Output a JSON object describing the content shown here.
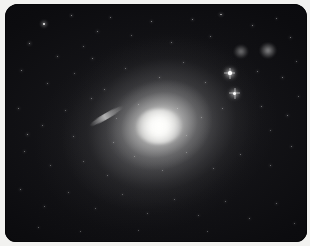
{
  "image": {
    "title": "Giant elliptical galaxy with surrounding star field",
    "subject": "elliptical-galaxy",
    "frame_color": "#f2f2f0",
    "sky_color": "#050507",
    "core_color": "#fffffd",
    "halo_color": "#9a9a9a",
    "frame": {
      "border_px": 5,
      "corner_radius_px": 13
    },
    "galaxy": {
      "label": "central elliptical galaxy",
      "center_x_pct": 50.5,
      "center_y_pct": 51.0,
      "position_angle_deg": -20,
      "core_brightness": 100,
      "halo_extent_pct": 96
    },
    "features": [
      {
        "name": "companion-galaxy-upper-right-a",
        "type": "fuzzy-galaxy",
        "x_pct": 78.0,
        "y_pct": 19.5,
        "size_pct": 4.6,
        "brightness": 52
      },
      {
        "name": "companion-galaxy-upper-right-b",
        "type": "fuzzy-galaxy",
        "x_pct": 87.0,
        "y_pct": 19.0,
        "size_pct": 5.4,
        "brightness": 62
      },
      {
        "name": "edge-on-galaxy-streak",
        "type": "edge-on-galaxy",
        "x_pct": 33.5,
        "y_pct": 47.5,
        "length_pct": 13,
        "angle_deg": -30,
        "brightness": 70
      },
      {
        "name": "bright-star-upper",
        "type": "star-with-spikes",
        "x_pct": 74.5,
        "y_pct": 29.0,
        "magnitude": 1
      },
      {
        "name": "bright-star-lower",
        "type": "star-with-spikes",
        "x_pct": 76.0,
        "y_pct": 37.5,
        "magnitude": 1
      }
    ],
    "stars": [
      {
        "x": 13.0,
        "y": 8.5,
        "r": 0.95,
        "o": 0.95
      },
      {
        "x": 22.0,
        "y": 5.0,
        "r": 0.55,
        "o": 0.6
      },
      {
        "x": 30.5,
        "y": 11.5,
        "r": 0.5,
        "o": 0.55
      },
      {
        "x": 8.0,
        "y": 16.5,
        "r": 0.6,
        "o": 0.65
      },
      {
        "x": 17.5,
        "y": 22.0,
        "r": 0.45,
        "o": 0.5
      },
      {
        "x": 26.0,
        "y": 18.0,
        "r": 0.4,
        "o": 0.45
      },
      {
        "x": 35.0,
        "y": 5.5,
        "r": 0.45,
        "o": 0.5
      },
      {
        "x": 42.0,
        "y": 13.0,
        "r": 0.4,
        "o": 0.42
      },
      {
        "x": 48.5,
        "y": 7.5,
        "r": 0.5,
        "o": 0.55
      },
      {
        "x": 55.0,
        "y": 16.0,
        "r": 0.45,
        "o": 0.48
      },
      {
        "x": 62.0,
        "y": 6.5,
        "r": 0.55,
        "o": 0.58
      },
      {
        "x": 68.0,
        "y": 13.5,
        "r": 0.45,
        "o": 0.48
      },
      {
        "x": 71.5,
        "y": 4.5,
        "r": 0.6,
        "o": 0.62
      },
      {
        "x": 82.0,
        "y": 9.0,
        "r": 0.5,
        "o": 0.55
      },
      {
        "x": 90.0,
        "y": 6.0,
        "r": 0.45,
        "o": 0.48
      },
      {
        "x": 94.5,
        "y": 14.0,
        "r": 0.5,
        "o": 0.52
      },
      {
        "x": 5.5,
        "y": 28.0,
        "r": 0.5,
        "o": 0.52
      },
      {
        "x": 14.0,
        "y": 33.5,
        "r": 0.45,
        "o": 0.48
      },
      {
        "x": 23.0,
        "y": 29.0,
        "r": 0.4,
        "o": 0.42
      },
      {
        "x": 33.0,
        "y": 36.0,
        "r": 0.45,
        "o": 0.46
      },
      {
        "x": 40.0,
        "y": 27.0,
        "r": 0.42,
        "o": 0.44
      },
      {
        "x": 51.0,
        "y": 31.0,
        "r": 0.45,
        "o": 0.45
      },
      {
        "x": 59.0,
        "y": 24.5,
        "r": 0.4,
        "o": 0.42
      },
      {
        "x": 66.5,
        "y": 33.0,
        "r": 0.45,
        "o": 0.46
      },
      {
        "x": 83.5,
        "y": 28.5,
        "r": 0.45,
        "o": 0.48
      },
      {
        "x": 92.0,
        "y": 31.0,
        "r": 0.5,
        "o": 0.52
      },
      {
        "x": 96.5,
        "y": 24.0,
        "r": 0.42,
        "o": 0.44
      },
      {
        "x": 4.5,
        "y": 44.0,
        "r": 0.5,
        "o": 0.5
      },
      {
        "x": 12.5,
        "y": 51.0,
        "r": 0.45,
        "o": 0.46
      },
      {
        "x": 20.0,
        "y": 44.5,
        "r": 0.4,
        "o": 0.42
      },
      {
        "x": 28.5,
        "y": 39.5,
        "r": 0.45,
        "o": 0.46
      },
      {
        "x": 22.5,
        "y": 55.5,
        "r": 0.45,
        "o": 0.44
      },
      {
        "x": 36.0,
        "y": 58.0,
        "r": 0.4,
        "o": 0.4
      },
      {
        "x": 44.0,
        "y": 42.0,
        "r": 0.38,
        "o": 0.38
      },
      {
        "x": 57.0,
        "y": 44.0,
        "r": 0.38,
        "o": 0.36
      },
      {
        "x": 65.0,
        "y": 47.5,
        "r": 0.4,
        "o": 0.4
      },
      {
        "x": 72.0,
        "y": 44.0,
        "r": 0.42,
        "o": 0.44
      },
      {
        "x": 85.0,
        "y": 43.0,
        "r": 0.45,
        "o": 0.48
      },
      {
        "x": 93.5,
        "y": 47.0,
        "r": 0.5,
        "o": 0.52
      },
      {
        "x": 97.0,
        "y": 39.0,
        "r": 0.42,
        "o": 0.44
      },
      {
        "x": 6.5,
        "y": 62.0,
        "r": 0.48,
        "o": 0.48
      },
      {
        "x": 15.0,
        "y": 68.0,
        "r": 0.42,
        "o": 0.42
      },
      {
        "x": 26.0,
        "y": 66.0,
        "r": 0.4,
        "o": 0.4
      },
      {
        "x": 34.0,
        "y": 72.0,
        "r": 0.42,
        "o": 0.4
      },
      {
        "x": 43.0,
        "y": 64.0,
        "r": 0.38,
        "o": 0.36
      },
      {
        "x": 52.0,
        "y": 70.0,
        "r": 0.4,
        "o": 0.38
      },
      {
        "x": 60.0,
        "y": 62.5,
        "r": 0.38,
        "o": 0.36
      },
      {
        "x": 69.0,
        "y": 69.0,
        "r": 0.42,
        "o": 0.42
      },
      {
        "x": 78.0,
        "y": 63.0,
        "r": 0.42,
        "o": 0.44
      },
      {
        "x": 88.0,
        "y": 68.0,
        "r": 0.45,
        "o": 0.46
      },
      {
        "x": 95.0,
        "y": 60.0,
        "r": 0.45,
        "o": 0.46
      },
      {
        "x": 5.0,
        "y": 78.0,
        "r": 0.5,
        "o": 0.5
      },
      {
        "x": 13.0,
        "y": 85.0,
        "r": 0.45,
        "o": 0.44
      },
      {
        "x": 21.0,
        "y": 79.0,
        "r": 0.42,
        "o": 0.42
      },
      {
        "x": 30.0,
        "y": 86.0,
        "r": 0.42,
        "o": 0.4
      },
      {
        "x": 39.0,
        "y": 80.0,
        "r": 0.4,
        "o": 0.38
      },
      {
        "x": 47.0,
        "y": 88.0,
        "r": 0.42,
        "o": 0.4
      },
      {
        "x": 56.0,
        "y": 82.0,
        "r": 0.4,
        "o": 0.38
      },
      {
        "x": 64.0,
        "y": 89.0,
        "r": 0.42,
        "o": 0.4
      },
      {
        "x": 73.0,
        "y": 83.0,
        "r": 0.42,
        "o": 0.42
      },
      {
        "x": 81.0,
        "y": 90.0,
        "r": 0.45,
        "o": 0.44
      },
      {
        "x": 90.0,
        "y": 84.0,
        "r": 0.45,
        "o": 0.46
      },
      {
        "x": 96.0,
        "y": 92.0,
        "r": 0.42,
        "o": 0.42
      },
      {
        "x": 11.0,
        "y": 94.0,
        "r": 0.45,
        "o": 0.44
      },
      {
        "x": 25.0,
        "y": 95.5,
        "r": 0.4,
        "o": 0.38
      },
      {
        "x": 44.0,
        "y": 95.0,
        "r": 0.38,
        "o": 0.36
      },
      {
        "x": 67.0,
        "y": 95.5,
        "r": 0.4,
        "o": 0.38
      },
      {
        "x": 7.5,
        "y": 55.0,
        "r": 0.55,
        "o": 0.58
      },
      {
        "x": 29.0,
        "y": 23.0,
        "r": 0.5,
        "o": 0.52
      },
      {
        "x": 37.0,
        "y": 48.0,
        "r": 0.38,
        "o": 0.34
      },
      {
        "x": 60.0,
        "y": 55.0,
        "r": 0.36,
        "o": 0.32
      },
      {
        "x": 88.0,
        "y": 53.0,
        "r": 0.4,
        "o": 0.4
      }
    ]
  }
}
